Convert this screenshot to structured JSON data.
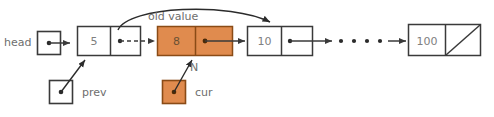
{
  "diagram": {
    "colors": {
      "node_fill_plain": "#ffffff",
      "node_fill_highlight": "#E08B4E",
      "stroke": "#3a3a3a",
      "stroke_highlight": "#8a4b16",
      "text_grey": "#808080",
      "label_grey": "#6e6e6e",
      "background": "#ffffff"
    },
    "labels": {
      "head": "head",
      "prev": "prev",
      "cur": "cur",
      "n": "N",
      "old_value": "old value"
    },
    "nodes": [
      {
        "id": "node-5",
        "value": "5",
        "highlight": false,
        "null_next": false
      },
      {
        "id": "node-8",
        "value": "8",
        "highlight": true,
        "null_next": false
      },
      {
        "id": "node-10",
        "value": "10",
        "highlight": false,
        "null_next": false
      },
      {
        "id": "node-100",
        "value": "100",
        "highlight": false,
        "null_next": true
      }
    ],
    "ellipsis": {
      "dots": 4
    },
    "pointer_boxes": [
      {
        "id": "head-box",
        "highlight": false
      },
      {
        "id": "prev-box",
        "highlight": false
      },
      {
        "id": "cur-box",
        "highlight": true
      }
    ]
  }
}
